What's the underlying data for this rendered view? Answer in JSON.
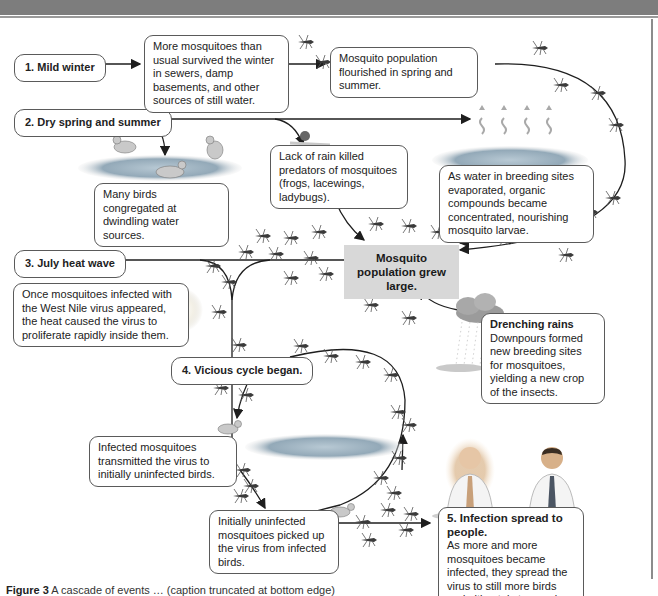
{
  "diagram": {
    "steps": [
      {
        "id": "step1",
        "label": "1. Mild winter"
      },
      {
        "id": "step2",
        "label": "2. Dry spring and summer"
      },
      {
        "id": "step3",
        "label": "3. July heat wave"
      },
      {
        "id": "step4",
        "label": "4. Vicious cycle began."
      },
      {
        "id": "step5",
        "label": "5. Infection spread to people."
      }
    ],
    "notes": {
      "winter_survival": "More mosquitoes than usual survived the winter in sewers, damp basements, and other sources of still water.",
      "population_flourished": "Mosquito population flourished in spring and summer.",
      "birds_congregated": "Many birds congregated at dwindling water sources.",
      "predators_killed": "Lack of rain killed predators of mosquitoes (frogs, lacewings, ladybugs).",
      "water_evaporated": "As water in breeding sites evaporated, organic compounds became concentrated, nourishing mosquito larvae.",
      "population_grew": "Mosquito population grew large.",
      "heat_virus": "Once mosquitoes infected with the West Nile virus appeared, the heat caused the virus to proliferate rapidly inside them.",
      "drenching_rains_title": "Drenching rains",
      "drenching_rains_body": "Downpours formed new breeding sites for mosquitoes, yielding a new crop of the insects.",
      "mosquitoes_to_birds": "Infected mosquitoes transmitted the virus to initially uninfected birds.",
      "birds_to_mosquitoes": "Initially uninfected mosquitoes picked up the virus from infected birds.",
      "spread_to_people_body": "As more and more mosquitoes became infected, they spread the virus to still more birds and ultimately to people."
    },
    "illustrations": [
      "mosquito-icon",
      "bird-icon",
      "pond-icon",
      "predator-insect-icon",
      "evaporation-icon",
      "sun-icon",
      "rain-cloud-icon",
      "person-icon"
    ],
    "colors": {
      "header_bar": "#7d7d7d",
      "center_box": "#d8d8d8",
      "arrow": "#1e1e1e",
      "pond": "#8fa7b8",
      "mosquito": "#3a3a3a"
    }
  },
  "caption": {
    "label": "Figure 3",
    "text": "A cascade of events … (caption truncated at bottom edge)"
  }
}
